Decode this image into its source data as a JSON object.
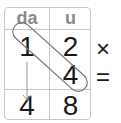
{
  "table": {
    "headers": [
      "da",
      "u"
    ],
    "rows": [
      [
        "1",
        "2"
      ],
      [
        "",
        "4"
      ]
    ],
    "result": [
      "4",
      "8"
    ]
  },
  "operators": {
    "multiply": "×",
    "equals": "="
  },
  "annotations": {
    "diagonal_capsule": "encloses da-1 and u-4",
    "arrow": "from da-1 down to result da"
  },
  "colors": {
    "header_text": "#8a8a8a",
    "grid_line": "#c8c8c8",
    "digit": "#1a1a1a",
    "annotation": "#777777"
  }
}
